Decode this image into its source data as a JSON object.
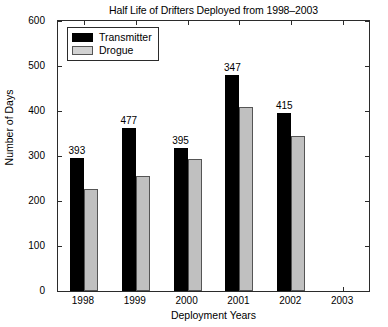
{
  "chart_data": {
    "type": "bar",
    "title": "Half Life of Drifters Deployed from 1998–2003",
    "xlabel": "Deployment Years",
    "ylabel": "Number of Days",
    "categories": [
      "1998",
      "1999",
      "2000",
      "2001",
      "2002",
      "2003"
    ],
    "ylim": [
      0,
      600
    ],
    "yticks": [
      0,
      100,
      200,
      300,
      400,
      500,
      600
    ],
    "ytick_labels": [
      "0",
      "100",
      "200",
      "300",
      "400",
      "500",
      "600"
    ],
    "grid": false,
    "legend_position": "upper left",
    "series": [
      {
        "name": "Transmitter",
        "color": "#000000",
        "values": [
          295,
          362,
          318,
          479,
          395,
          null
        ]
      },
      {
        "name": "Drogue",
        "color": "#c0c0c0",
        "values": [
          227,
          256,
          293,
          410,
          344,
          null
        ]
      }
    ],
    "annotations": [
      {
        "category": "1998",
        "text": "393"
      },
      {
        "category": "1999",
        "text": "477"
      },
      {
        "category": "2000",
        "text": "395"
      },
      {
        "category": "2001",
        "text": "347"
      },
      {
        "category": "2002",
        "text": "415"
      }
    ]
  }
}
